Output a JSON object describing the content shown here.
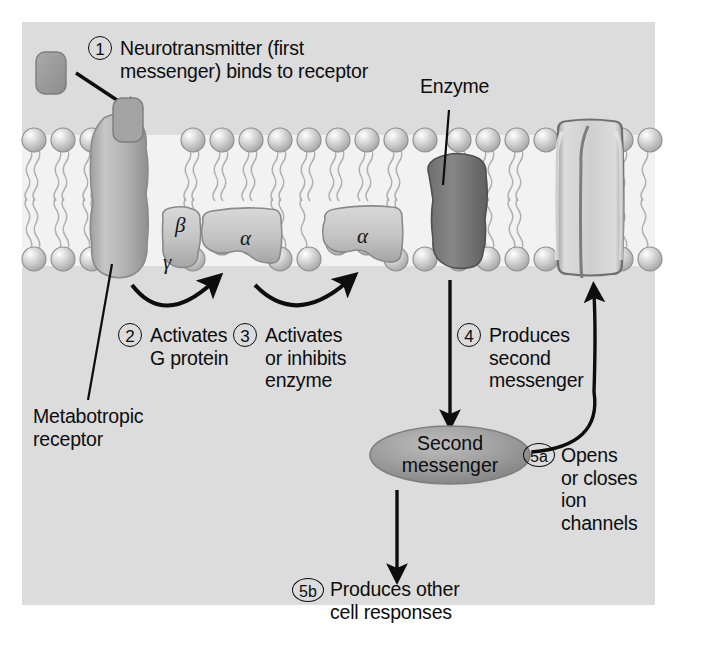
{
  "figure": {
    "background_color": "#ffffff",
    "panel_color": "#dcdcdc",
    "membrane_head_color": "#c9c9c9",
    "receptor_color": "#b6b6b6",
    "gprotein_color": "#c3c3c3",
    "enzyme_color": "#7a7a7a",
    "channel_color": "#cfcfcf",
    "ligand_color": "#9a9a9a",
    "second_messenger_color": "#9e9e9e",
    "line_color": "#0d0d0d"
  },
  "steps": [
    {
      "id": "1",
      "marker": "1",
      "text": "Neurotransmitter (first\nmessenger) binds to receptor"
    },
    {
      "id": "2",
      "marker": "2",
      "text": "Activates\nG protein"
    },
    {
      "id": "3",
      "marker": "3",
      "text": "Activates\nor inhibits\nenzyme"
    },
    {
      "id": "4",
      "marker": "4",
      "text": "Produces\nsecond\nmessenger"
    },
    {
      "id": "5a",
      "marker": "5a",
      "text": "Opens\nor closes\nion\nchannels"
    },
    {
      "id": "5b",
      "marker": "5b",
      "text": "Produces other\ncell responses"
    }
  ],
  "labels": {
    "enzyme": "Enzyme",
    "metabotropic_receptor": "Metabotropic\nreceptor",
    "second_messenger": "Second\nmessenger"
  },
  "subunits": [
    {
      "name": "beta",
      "symbol": "β"
    },
    {
      "name": "gamma",
      "symbol": "γ"
    },
    {
      "name": "alpha1",
      "symbol": "α"
    },
    {
      "name": "alpha2",
      "symbol": "α"
    }
  ]
}
